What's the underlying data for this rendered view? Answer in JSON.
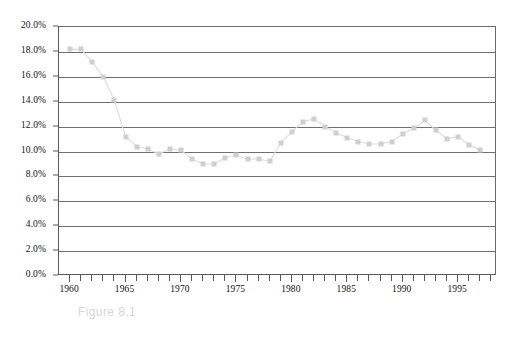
{
  "figure": {
    "caption": "Figure 8.1"
  },
  "chart_data": {
    "type": "line",
    "title": "",
    "subtitle": "",
    "xlabel": "",
    "ylabel": "",
    "marker": "square",
    "marker_color": "#cfcfcf",
    "line_color": "#dcdcdc",
    "grid": true,
    "grid_axis": "y",
    "legend": "none",
    "xlim": [
      1959,
      1998.5
    ],
    "ylim": [
      0.0,
      20.0
    ],
    "ytick_step": 2.0,
    "ytick_labels": [
      "0.0%",
      "2.0%",
      "4.0%",
      "6.0%",
      "8.0%",
      "10.0%",
      "12.0%",
      "14.0%",
      "16.0%",
      "18.0%",
      "20.0%"
    ],
    "ytick_values": [
      0.0,
      2.0,
      4.0,
      6.0,
      8.0,
      10.0,
      12.0,
      14.0,
      16.0,
      18.0,
      20.0
    ],
    "xtick_labels": [
      "1960",
      "1965",
      "1970",
      "1975",
      "1980",
      "1985",
      "1990",
      "1995"
    ],
    "xtick_values": [
      1960,
      1965,
      1970,
      1975,
      1980,
      1985,
      1990,
      1995
    ],
    "xtick_minor_step": 1,
    "x": [
      1960,
      1961,
      1962,
      1963,
      1964,
      1965,
      1966,
      1967,
      1968,
      1969,
      1970,
      1971,
      1972,
      1973,
      1974,
      1975,
      1976,
      1977,
      1978,
      1979,
      1980,
      1981,
      1982,
      1983,
      1984,
      1985,
      1986,
      1987,
      1988,
      1989,
      1990,
      1991,
      1992,
      1993,
      1994,
      1995,
      1996,
      1997
    ],
    "values": [
      18.2,
      18.2,
      17.2,
      16.0,
      14.1,
      11.2,
      10.4,
      10.2,
      9.8,
      10.2,
      10.1,
      9.4,
      9.0,
      9.0,
      9.5,
      9.7,
      9.4,
      9.4,
      9.2,
      10.7,
      11.6,
      12.4,
      12.6,
      12.0,
      11.5,
      11.1,
      10.8,
      10.6,
      10.6,
      10.8,
      11.4,
      11.9,
      12.5,
      11.7,
      11.0,
      11.2,
      10.5,
      10.1
    ],
    "series": [
      {
        "name": "series-1",
        "values": [
          18.2,
          18.2,
          17.2,
          16.0,
          14.1,
          11.2,
          10.4,
          10.2,
          9.8,
          10.2,
          10.1,
          9.4,
          9.0,
          9.0,
          9.5,
          9.7,
          9.4,
          9.4,
          9.2,
          10.7,
          11.6,
          12.4,
          12.6,
          12.0,
          11.5,
          11.1,
          10.8,
          10.6,
          10.6,
          10.8,
          11.4,
          11.9,
          12.5,
          11.7,
          11.0,
          11.2,
          10.5,
          10.1
        ]
      }
    ]
  }
}
